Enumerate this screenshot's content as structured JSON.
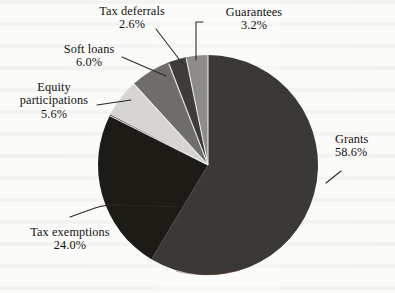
{
  "figure": {
    "background_color": "#fbfbfa",
    "text_color": "#131211",
    "leader_line_color": "#2a2724"
  },
  "chart_data": {
    "type": "pie",
    "title": "",
    "subtitle": "",
    "xlabel": "",
    "ylabel": "",
    "legend_position": "none",
    "labels_position": "outside-with-leader-lines",
    "grid": false,
    "units": "percent",
    "total": 100.0,
    "start_angle_deg": 90,
    "direction": "clockwise",
    "categories": [
      "Grants",
      "Tax exemptions",
      "Soft loans",
      "Equity participations",
      "Guarantees",
      "Tax deferrals"
    ],
    "values": [
      58.6,
      24.0,
      6.0,
      5.6,
      3.2,
      2.6
    ],
    "slices": [
      {
        "name": "Grants",
        "label": "Grants",
        "value": 58.6,
        "value_text": "58.6%",
        "color": "#3b3936",
        "order": 1
      },
      {
        "name": "Tax exemptions",
        "label": "Tax exemptions",
        "value": 24.0,
        "value_text": "24.0%",
        "color": "#1d1b16",
        "order": 2
      },
      {
        "name": "Equity participations",
        "label": "Equity participations",
        "value": 5.6,
        "value_text": "5.6%",
        "color": "#d6d5d2",
        "order": 3
      },
      {
        "name": "Soft loans",
        "label": "Soft loans",
        "value": 6.0,
        "value_text": "6.0%",
        "color": "#6f6d69",
        "order": 4
      },
      {
        "name": "Tax deferrals",
        "label": "Tax deferrals",
        "value": 2.6,
        "value_text": "2.6%",
        "color": "#3e3c39",
        "order": 5
      },
      {
        "name": "Guarantees",
        "label": "Guarantees",
        "value": 3.2,
        "value_text": "3.2%",
        "color": "#8e8c88",
        "order": 6
      }
    ]
  },
  "labels": {
    "tax_deferrals": {
      "name": "Tax deferrals",
      "percent": "2.6%"
    },
    "guarantees": {
      "name": "Guarantees",
      "percent": "3.2%"
    },
    "soft_loans": {
      "name": "Soft loans",
      "percent": "6.0%"
    },
    "equity_participations": {
      "name_line1": "Equity",
      "name_line2": "participations",
      "percent": "5.6%"
    },
    "grants": {
      "name": "Grants",
      "percent": "58.6%"
    },
    "tax_exemptions": {
      "name": "Tax exemptions",
      "percent": "24.0%"
    }
  }
}
